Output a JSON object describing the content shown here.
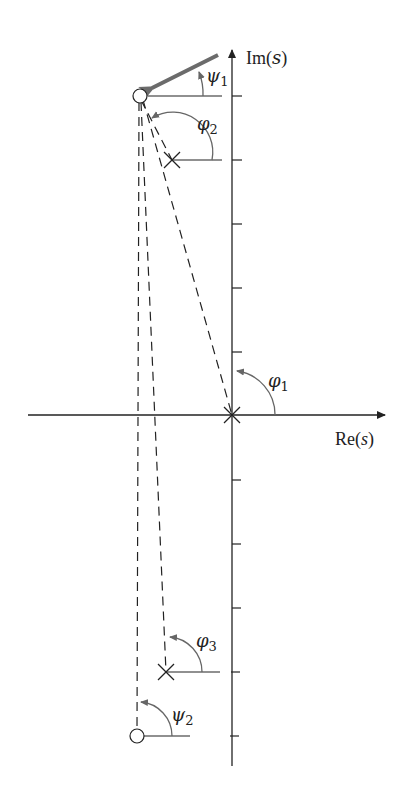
{
  "diagram": {
    "type": "root-locus-angle-diagram",
    "axes": {
      "imag_label": "Im(s)",
      "imag_label_prefix": "Im",
      "imag_label_var": "s",
      "real_label_prefix": "Re",
      "real_label_var": "s",
      "real_label": "Re(s)",
      "tick_count_upper": 5,
      "tick_count_lower": 5
    },
    "angles": {
      "psi1": {
        "symbol": "ψ",
        "sub": "1"
      },
      "phi2": {
        "symbol": "φ",
        "sub": "2"
      },
      "phi1": {
        "symbol": "φ",
        "sub": "1"
      },
      "phi3": {
        "symbol": "φ",
        "sub": "3"
      },
      "psi2": {
        "symbol": "ψ",
        "sub": "2"
      }
    },
    "markers": {
      "zeros": [
        {
          "name": "upper-zero",
          "x": 140,
          "y": 96
        },
        {
          "name": "lower-zero",
          "x": 137,
          "y": 736
        }
      ],
      "poles": [
        {
          "name": "upper-pole",
          "x": 172,
          "y": 160
        },
        {
          "name": "origin-pole",
          "x": 232,
          "y": 415
        },
        {
          "name": "lower-pole",
          "x": 166,
          "y": 672
        }
      ]
    },
    "colors": {
      "axis": "#222222",
      "arrow_thick": "#6b6b6b",
      "angle_arc": "#666666"
    }
  }
}
